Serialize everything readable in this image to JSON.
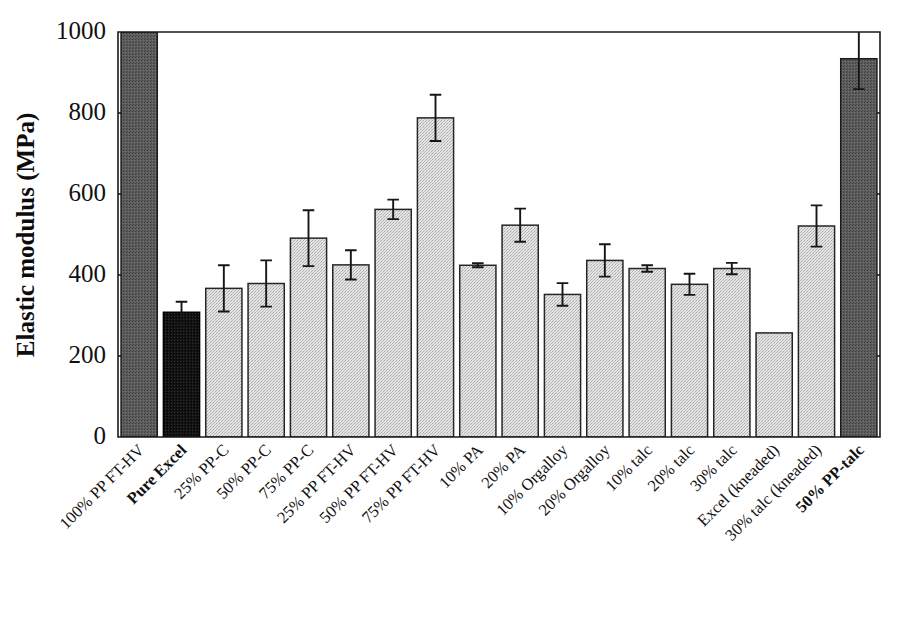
{
  "chart_data": {
    "type": "bar",
    "title": "",
    "xlabel": "",
    "ylabel": "Elastic modulus (MPa)",
    "ylim": [
      0,
      1000
    ],
    "ytick_labels": [
      "0",
      "200",
      "400",
      "600",
      "800",
      "1000"
    ],
    "ytick_values": [
      0,
      200,
      400,
      600,
      800,
      1000
    ],
    "grid": false,
    "legend": "none",
    "note_clipped": "first bar extends beyond axis top (1000 MPa)",
    "categories": [
      "100% PP FT-HV",
      "Pure Excel",
      "25% PP-C",
      "50% PP-C",
      "75% PP-C",
      "25% PP FT-HV",
      "50% PP FT-HV",
      "75% PP FT-HV",
      "10% PA",
      "20% PA",
      "10% Orgalloy",
      "20% Orgalloy",
      "10% talc",
      "20% talc",
      "30% talc",
      "Excel (kneaded)",
      "30% talc (kneaded)",
      "50% PP-talc"
    ],
    "values": [
      1000,
      308,
      367,
      379,
      491,
      425,
      562,
      788,
      424,
      523,
      352,
      436,
      416,
      377,
      416,
      257,
      521,
      934
    ],
    "errors": [
      0,
      26,
      57,
      57,
      69,
      36,
      24,
      57,
      5,
      41,
      28,
      40,
      8,
      26,
      14,
      0,
      51,
      75
    ],
    "bar_colors": [
      "dark-gray",
      "black",
      "light-gray",
      "light-gray",
      "light-gray",
      "light-gray",
      "light-gray",
      "light-gray",
      "light-gray",
      "light-gray",
      "light-gray",
      "light-gray",
      "light-gray",
      "light-gray",
      "light-gray",
      "light-gray",
      "light-gray",
      "dark-gray"
    ],
    "bold_labels": [
      "Pure Excel",
      "50% PP-talc"
    ],
    "colors": {
      "light_gray": "#d2d2d2",
      "dark_gray": "#585858",
      "black": "#111111",
      "axis": "#1a1a1a"
    }
  }
}
